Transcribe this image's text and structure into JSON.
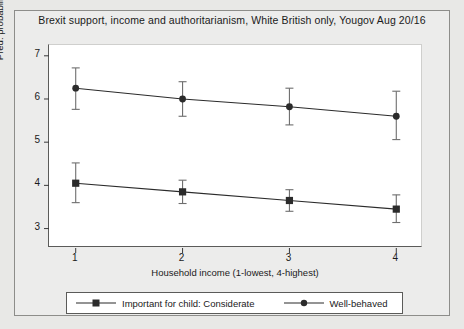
{
  "chart_data": {
    "type": "line",
    "title": "Brexit support, income and authoritarianism, White British only, Yougov Aug 20/16",
    "xlabel": "Household income (1-lowest, 4-highest)",
    "ylabel": "Pred. probability of having voted for Brexit",
    "x": [
      1,
      2,
      3,
      4
    ],
    "xticklabels": [
      "1",
      "2",
      "3",
      "4"
    ],
    "yticklabels": [
      "3",
      "4",
      "5",
      "6",
      "7"
    ],
    "yticks": [
      3,
      4,
      5,
      6,
      7
    ],
    "xlim": [
      0.75,
      4.25
    ],
    "ylim": [
      2.55,
      7.25
    ],
    "grid": false,
    "legend_position": "below",
    "series": [
      {
        "name": "Important for child: Considerate",
        "marker": "square",
        "color": "#2b2b2b",
        "values": [
          4.05,
          3.85,
          3.65,
          3.45
        ],
        "ci_low": [
          3.6,
          3.58,
          3.4,
          3.14
        ],
        "ci_high": [
          4.52,
          4.12,
          3.9,
          3.78
        ]
      },
      {
        "name": "Well-behaved",
        "marker": "circle",
        "color": "#2b2b2b",
        "values": [
          6.25,
          6.0,
          5.82,
          5.6
        ],
        "ci_low": [
          5.76,
          5.6,
          5.4,
          5.06
        ],
        "ci_high": [
          6.72,
          6.4,
          6.25,
          6.18
        ]
      }
    ]
  },
  "figure": {
    "background_color": "#e8e8e6",
    "plot_background_color": "#ffffff",
    "frame_color": "#8d8d8a"
  }
}
